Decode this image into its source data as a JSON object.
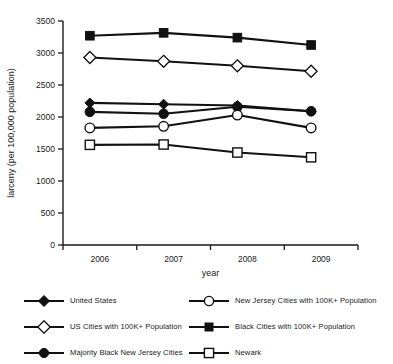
{
  "chart_data": {
    "type": "line",
    "title": "",
    "xlabel": "year",
    "ylabel": "larceny (per 100,000 population)",
    "categories": [
      "2006",
      "2007",
      "2008",
      "2009"
    ],
    "x_tick_labels": [
      "2006",
      "2007",
      "2008",
      "2009"
    ],
    "y_tick_labels": [
      "0",
      "500",
      "1000",
      "1500",
      "2000",
      "2500",
      "3000",
      "3500"
    ],
    "y_ticks": [
      0,
      500,
      1000,
      1500,
      2000,
      2500,
      3000,
      3500
    ],
    "ylim": [
      0,
      3500
    ],
    "grid": false,
    "legend_position": "below",
    "series": [
      {
        "name": "United States",
        "marker": "filled-diamond",
        "values": [
          2220,
          2200,
          2180,
          2090
        ]
      },
      {
        "name": "US Cities with 100K+ Population",
        "marker": "open-diamond",
        "values": [
          2930,
          2870,
          2800,
          2715
        ]
      },
      {
        "name": "Majority Black New Jersey Cities",
        "marker": "filled-circle",
        "values": [
          2080,
          2050,
          2160,
          2090
        ]
      },
      {
        "name": "New Jersey Cities with 100K+ Population",
        "marker": "open-circle",
        "values": [
          1830,
          1855,
          2030,
          1830
        ]
      },
      {
        "name": "Black Cities with 100K+ Population",
        "marker": "filled-square",
        "values": [
          3270,
          3315,
          3240,
          3125
        ]
      },
      {
        "name": "Newark",
        "marker": "open-square",
        "values": [
          1565,
          1570,
          1445,
          1370
        ]
      }
    ]
  },
  "legend": {
    "entries": [
      {
        "label": "United States",
        "marker": "filled-diamond"
      },
      {
        "label": "New Jersey Cities with 100K+ Population",
        "marker": "open-circle"
      },
      {
        "label": "US Cities with 100K+ Population",
        "marker": "open-diamond"
      },
      {
        "label": "Black Cities with 100K+ Population",
        "marker": "filled-square"
      },
      {
        "label": "Majority Black New Jersey Cities",
        "marker": "filled-circle"
      },
      {
        "label": "Newark",
        "marker": "open-square"
      }
    ]
  },
  "colors": {
    "line": "#111111",
    "marker_fill": "#111111",
    "marker_open_fill": "#ffffff",
    "axis": "#1a1a1a",
    "background": "#ffffff"
  }
}
